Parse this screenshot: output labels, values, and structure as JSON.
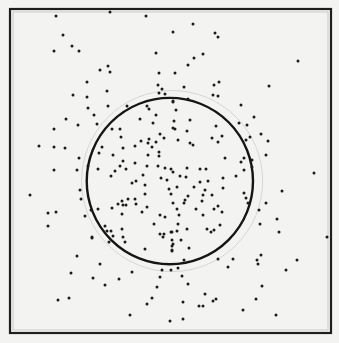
{
  "diagram": {
    "colors": {
      "background": "#f3f3f1",
      "ink": "#1a1a1a",
      "faint": "#d6d6d2"
    },
    "units": "fractions of the square frame (0,0 = top-left, 1,1 = bottom-right)",
    "circle": {
      "cx": 0.498,
      "cy": 0.531,
      "r": 0.259
    },
    "faint_circle": {
      "cx": 0.505,
      "cy": 0.531,
      "r": 0.282
    },
    "dots": [
      [
        0.143,
        0.022
      ],
      [
        0.312,
        0.009
      ],
      [
        0.424,
        0.022
      ],
      [
        0.57,
        0.046
      ],
      [
        0.508,
        0.071
      ],
      [
        0.639,
        0.074
      ],
      [
        0.648,
        0.086
      ],
      [
        0.165,
        0.08
      ],
      [
        0.193,
        0.114
      ],
      [
        0.137,
        0.13
      ],
      [
        0.215,
        0.13
      ],
      [
        0.455,
        0.136
      ],
      [
        0.601,
        0.139
      ],
      [
        0.573,
        0.151
      ],
      [
        0.897,
        0.16
      ],
      [
        0.555,
        0.173
      ],
      [
        0.28,
        0.188
      ],
      [
        0.305,
        0.176
      ],
      [
        0.312,
        0.194
      ],
      [
        0.464,
        0.198
      ],
      [
        0.514,
        0.198
      ],
      [
        0.24,
        0.225
      ],
      [
        0.651,
        0.225
      ],
      [
        0.461,
        0.235
      ],
      [
        0.542,
        0.241
      ],
      [
        0.636,
        0.235
      ],
      [
        0.807,
        0.238
      ],
      [
        0.473,
        0.247
      ],
      [
        0.302,
        0.253
      ],
      [
        0.464,
        0.259
      ],
      [
        0.483,
        0.262
      ],
      [
        0.196,
        0.265
      ],
      [
        0.24,
        0.272
      ],
      [
        0.632,
        0.265
      ],
      [
        0.648,
        0.269
      ],
      [
        0.508,
        0.284
      ],
      [
        0.555,
        0.278
      ],
      [
        0.243,
        0.306
      ],
      [
        0.174,
        0.34
      ],
      [
        0.212,
        0.358
      ],
      [
        0.137,
        0.37
      ],
      [
        0.09,
        0.423
      ],
      [
        0.137,
        0.426
      ],
      [
        0.171,
        0.429
      ],
      [
        0.215,
        0.46
      ],
      [
        0.137,
        0.497
      ],
      [
        0.209,
        0.497
      ],
      [
        0.062,
        0.574
      ],
      [
        0.218,
        0.559
      ],
      [
        0.221,
        0.586
      ],
      [
        0.118,
        0.63
      ],
      [
        0.143,
        0.627
      ],
      [
        0.234,
        0.639
      ],
      [
        0.118,
        0.67
      ],
      [
        0.255,
        0.704
      ],
      [
        0.209,
        0.762
      ],
      [
        0.76,
        0.333
      ],
      [
        0.738,
        0.358
      ],
      [
        0.782,
        0.386
      ],
      [
        0.748,
        0.395
      ],
      [
        0.804,
        0.407
      ],
      [
        0.798,
        0.451
      ],
      [
        0.947,
        0.506
      ],
      [
        0.847,
        0.562
      ],
      [
        0.798,
        0.599
      ],
      [
        0.776,
        0.62
      ],
      [
        0.832,
        0.648
      ],
      [
        0.779,
        0.664
      ],
      [
        0.838,
        0.688
      ],
      [
        0.988,
        0.704
      ],
      [
        0.782,
        0.759
      ],
      [
        0.769,
        0.775
      ],
      [
        0.773,
        0.787
      ],
      [
        0.894,
        0.775
      ],
      [
        0.28,
        0.787
      ],
      [
        0.19,
        0.815
      ],
      [
        0.259,
        0.83
      ],
      [
        0.34,
        0.833
      ],
      [
        0.38,
        0.812
      ],
      [
        0.474,
        0.806
      ],
      [
        0.502,
        0.806
      ],
      [
        0.523,
        0.799
      ],
      [
        0.467,
        0.827
      ],
      [
        0.536,
        0.824
      ],
      [
        0.679,
        0.796
      ],
      [
        0.773,
        0.787
      ],
      [
        0.86,
        0.806
      ],
      [
        0.296,
        0.852
      ],
      [
        0.458,
        0.858
      ],
      [
        0.555,
        0.849
      ],
      [
        0.785,
        0.855
      ],
      [
        0.607,
        0.88
      ],
      [
        0.15,
        0.898
      ],
      [
        0.184,
        0.892
      ],
      [
        0.442,
        0.892
      ],
      [
        0.427,
        0.91
      ],
      [
        0.539,
        0.904
      ],
      [
        0.589,
        0.917
      ],
      [
        0.601,
        0.917
      ],
      [
        0.632,
        0.901
      ],
      [
        0.642,
        0.895
      ],
      [
        0.766,
        0.895
      ],
      [
        0.726,
        0.929
      ],
      [
        0.374,
        0.944
      ],
      [
        0.498,
        0.963
      ],
      [
        0.539,
        0.957
      ],
      [
        0.829,
        0.944
      ],
      [
        0.305,
        0.299
      ],
      [
        0.364,
        0.299
      ],
      [
        0.427,
        0.299
      ],
      [
        0.433,
        0.309
      ],
      [
        0.262,
        0.327
      ],
      [
        0.405,
        0.34
      ],
      [
        0.455,
        0.327
      ],
      [
        0.271,
        0.355
      ],
      [
        0.445,
        0.352
      ],
      [
        0.318,
        0.37
      ],
      [
        0.343,
        0.37
      ],
      [
        0.508,
        0.367
      ],
      [
        0.346,
        0.395
      ],
      [
        0.467,
        0.386
      ],
      [
        0.408,
        0.407
      ],
      [
        0.433,
        0.401
      ],
      [
        0.48,
        0.398
      ],
      [
        0.389,
        0.423
      ],
      [
        0.43,
        0.414
      ],
      [
        0.455,
        0.411
      ],
      [
        0.287,
        0.426
      ],
      [
        0.352,
        0.429
      ],
      [
        0.442,
        0.426
      ],
      [
        0.464,
        0.441
      ],
      [
        0.277,
        0.444
      ],
      [
        0.321,
        0.451
      ],
      [
        0.43,
        0.451
      ],
      [
        0.464,
        0.454
      ],
      [
        0.243,
        0.485
      ],
      [
        0.274,
        0.494
      ],
      [
        0.343,
        0.485
      ],
      [
        0.352,
        0.469
      ],
      [
        0.389,
        0.475
      ],
      [
        0.427,
        0.485
      ],
      [
        0.461,
        0.485
      ],
      [
        0.483,
        0.491
      ],
      [
        0.502,
        0.494
      ],
      [
        0.327,
        0.5
      ],
      [
        0.361,
        0.494
      ],
      [
        0.315,
        0.515
      ],
      [
        0.414,
        0.512
      ],
      [
        0.47,
        0.522
      ],
      [
        0.489,
        0.528
      ],
      [
        0.38,
        0.537
      ],
      [
        0.393,
        0.531
      ],
      [
        0.508,
        0.287
      ],
      [
        0.555,
        0.278
      ],
      [
        0.517,
        0.312
      ],
      [
        0.72,
        0.296
      ],
      [
        0.76,
        0.333
      ],
      [
        0.511,
        0.346
      ],
      [
        0.561,
        0.343
      ],
      [
        0.713,
        0.352
      ],
      [
        0.738,
        0.358
      ],
      [
        0.514,
        0.37
      ],
      [
        0.551,
        0.377
      ],
      [
        0.642,
        0.361
      ],
      [
        0.629,
        0.398
      ],
      [
        0.66,
        0.392
      ],
      [
        0.648,
        0.41
      ],
      [
        0.523,
        0.404
      ],
      [
        0.561,
        0.414
      ],
      [
        0.57,
        0.42
      ],
      [
        0.748,
        0.395
      ],
      [
        0.735,
        0.404
      ],
      [
        0.67,
        0.46
      ],
      [
        0.729,
        0.46
      ],
      [
        0.72,
        0.472
      ],
      [
        0.754,
        0.466
      ],
      [
        0.754,
        0.488
      ],
      [
        0.551,
        0.491
      ],
      [
        0.592,
        0.494
      ],
      [
        0.611,
        0.494
      ],
      [
        0.729,
        0.497
      ],
      [
        0.508,
        0.503
      ],
      [
        0.53,
        0.515
      ],
      [
        0.548,
        0.519
      ],
      [
        0.592,
        0.534
      ],
      [
        0.617,
        0.531
      ],
      [
        0.664,
        0.522
      ],
      [
        0.704,
        0.515
      ],
      [
        0.38,
        0.537
      ],
      [
        0.421,
        0.543
      ],
      [
        0.495,
        0.556
      ],
      [
        0.502,
        0.571
      ],
      [
        0.349,
        0.593
      ],
      [
        0.368,
        0.586
      ],
      [
        0.389,
        0.586
      ],
      [
        0.421,
        0.571
      ],
      [
        0.336,
        0.602
      ],
      [
        0.352,
        0.605
      ],
      [
        0.361,
        0.605
      ],
      [
        0.393,
        0.602
      ],
      [
        0.508,
        0.599
      ],
      [
        0.427,
        0.611
      ],
      [
        0.274,
        0.617
      ],
      [
        0.252,
        0.62
      ],
      [
        0.318,
        0.614
      ],
      [
        0.349,
        0.633
      ],
      [
        0.411,
        0.627
      ],
      [
        0.467,
        0.636
      ],
      [
        0.483,
        0.642
      ],
      [
        0.449,
        0.664
      ],
      [
        0.296,
        0.67
      ],
      [
        0.302,
        0.685
      ],
      [
        0.315,
        0.685
      ],
      [
        0.349,
        0.679
      ],
      [
        0.467,
        0.694
      ],
      [
        0.48,
        0.694
      ],
      [
        0.502,
        0.688
      ],
      [
        0.477,
        0.704
      ],
      [
        0.255,
        0.707
      ],
      [
        0.321,
        0.701
      ],
      [
        0.352,
        0.704
      ],
      [
        0.308,
        0.719
      ],
      [
        0.358,
        0.719
      ],
      [
        0.505,
        0.713
      ],
      [
        0.505,
        0.731
      ],
      [
        0.421,
        0.741
      ],
      [
        0.505,
        0.744
      ],
      [
        0.52,
        0.549
      ],
      [
        0.573,
        0.549
      ],
      [
        0.592,
        0.534
      ],
      [
        0.664,
        0.552
      ],
      [
        0.608,
        0.559
      ],
      [
        0.555,
        0.577
      ],
      [
        0.601,
        0.574
      ],
      [
        0.63,
        0.574
      ],
      [
        0.729,
        0.568
      ],
      [
        0.508,
        0.599
      ],
      [
        0.542,
        0.599
      ],
      [
        0.545,
        0.59
      ],
      [
        0.598,
        0.593
      ],
      [
        0.735,
        0.583
      ],
      [
        0.741,
        0.599
      ],
      [
        0.52,
        0.617
      ],
      [
        0.579,
        0.617
      ],
      [
        0.636,
        0.617
      ],
      [
        0.66,
        0.627
      ],
      [
        0.648,
        0.608
      ],
      [
        0.601,
        0.636
      ],
      [
        0.526,
        0.636
      ],
      [
        0.523,
        0.664
      ],
      [
        0.654,
        0.667
      ],
      [
        0.614,
        0.679
      ],
      [
        0.626,
        0.688
      ],
      [
        0.636,
        0.682
      ],
      [
        0.551,
        0.679
      ],
      [
        0.505,
        0.688
      ],
      [
        0.52,
        0.685
      ],
      [
        0.505,
        0.713
      ],
      [
        0.533,
        0.713
      ],
      [
        0.508,
        0.725
      ],
      [
        0.558,
        0.738
      ],
      [
        0.504,
        0.747
      ],
      [
        0.542,
        0.775
      ],
      [
        0.648,
        0.772
      ],
      [
        0.695,
        0.772
      ]
    ]
  }
}
